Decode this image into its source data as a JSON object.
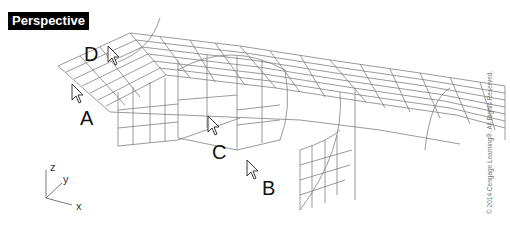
{
  "viewport": {
    "title": "Perspective"
  },
  "labels": {
    "A": "A",
    "B": "B",
    "C": "C",
    "D": "D"
  },
  "axes": {
    "x": "x",
    "y": "y",
    "z": "z"
  },
  "copyright": "© 2014 Cengage Learning®. All Rights Reserved.",
  "colors": {
    "wire": "#7a7a7a",
    "title_bg": "#000000",
    "title_fg": "#ffffff"
  },
  "icons": [
    "arrow-cursor-icon"
  ]
}
